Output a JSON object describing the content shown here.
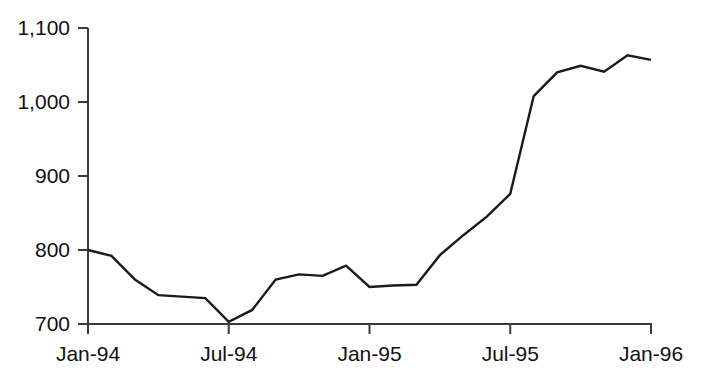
{
  "chart_data": {
    "type": "line",
    "title": "",
    "xlabel": "",
    "ylabel": "",
    "x": [
      "Jan-94",
      "Feb-94",
      "Mar-94",
      "Apr-94",
      "May-94",
      "Jun-94",
      "Jul-94",
      "Aug-94",
      "Sep-94",
      "Oct-94",
      "Nov-94",
      "Dec-94",
      "Jan-95",
      "Feb-95",
      "Mar-95",
      "Apr-95",
      "May-95",
      "Jun-95",
      "Jul-95",
      "Aug-95",
      "Sep-95",
      "Oct-95",
      "Nov-95",
      "Dec-95",
      "Jan-96"
    ],
    "values": [
      800,
      792,
      760,
      739,
      737,
      735,
      703,
      719,
      760,
      767,
      765,
      779,
      750,
      752,
      753,
      793,
      820,
      845,
      876,
      1008,
      1040,
      1049,
      1041,
      1063,
      1057
    ],
    "xlim": [
      "Jan-94",
      "Jan-96"
    ],
    "ylim": [
      700,
      1100
    ],
    "yticks": [
      700,
      800,
      900,
      1000,
      1100
    ],
    "ytick_labels": [
      "700",
      "800",
      "900",
      "1,000",
      "1,100"
    ],
    "xticks": [
      "Jan-94",
      "Jul-94",
      "Jan-95",
      "Jul-95",
      "Jan-96"
    ],
    "xtick_labels": [
      "Jan-94",
      "Jul-94",
      "Jan-95",
      "Jul-95",
      "Jan-96"
    ],
    "grid": false,
    "legend": false,
    "line_color": "#1a1a1a",
    "axis_color": "#3a3a3a",
    "background_color": "#ffffff",
    "series": [
      {
        "name": "series-1",
        "points": [
          {
            "x": "Jan-94",
            "y": 800
          },
          {
            "x": "Feb-94",
            "y": 792
          },
          {
            "x": "Mar-94",
            "y": 760
          },
          {
            "x": "Apr-94",
            "y": 739
          },
          {
            "x": "May-94",
            "y": 737
          },
          {
            "x": "Jun-94",
            "y": 735
          },
          {
            "x": "Jul-94",
            "y": 703
          },
          {
            "x": "Aug-94",
            "y": 719
          },
          {
            "x": "Sep-94",
            "y": 760
          },
          {
            "x": "Oct-94",
            "y": 767
          },
          {
            "x": "Nov-94",
            "y": 765
          },
          {
            "x": "Dec-94",
            "y": 779
          },
          {
            "x": "Jan-95",
            "y": 750
          },
          {
            "x": "Feb-95",
            "y": 752
          },
          {
            "x": "Mar-95",
            "y": 753
          },
          {
            "x": "Apr-95",
            "y": 793
          },
          {
            "x": "May-95",
            "y": 820
          },
          {
            "x": "Jun-95",
            "y": 845
          },
          {
            "x": "Jul-95",
            "y": 876
          },
          {
            "x": "Aug-95",
            "y": 1008
          },
          {
            "x": "Sep-95",
            "y": 1040
          },
          {
            "x": "Oct-95",
            "y": 1049
          },
          {
            "x": "Nov-95",
            "y": 1041
          },
          {
            "x": "Dec-95",
            "y": 1063
          },
          {
            "x": "Jan-96",
            "y": 1057
          }
        ]
      }
    ]
  },
  "axes": {
    "y_labels": [
      "1,100",
      "1,000",
      "900",
      "800",
      "700"
    ],
    "x_labels": [
      "Jan-94",
      "Jul-94",
      "Jan-95",
      "Jul-95",
      "Jan-96"
    ]
  }
}
